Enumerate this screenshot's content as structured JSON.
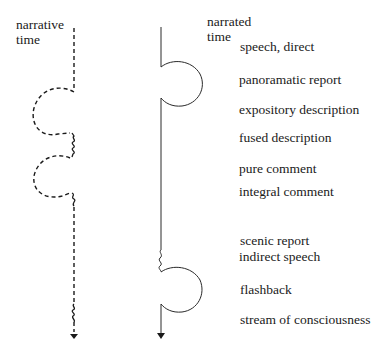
{
  "diagram": {
    "left_axis": {
      "title_line1": "narrative",
      "title_line2": "time",
      "style": "dashed"
    },
    "right_axis": {
      "title_line1": "narrated",
      "title_line2": "time",
      "style": "solid"
    },
    "labels": [
      "speech, direct",
      "panoramatic report",
      "expository description",
      "fused description",
      "pure comment",
      "integral comment",
      "scenic report",
      "indirect speech",
      "flashback",
      "stream of consciousness"
    ],
    "colors": {
      "ink": "#1a1a1a",
      "background": "#ffffff"
    }
  }
}
